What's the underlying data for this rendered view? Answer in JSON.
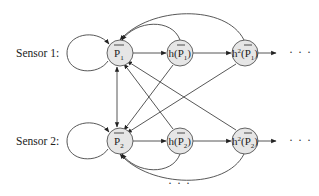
{
  "diagram": {
    "type": "state-transition graph",
    "rows": [
      {
        "label": "Sensor 1:",
        "nodes": [
          {
            "id": "P1",
            "base": "P",
            "sub": "1",
            "func": "",
            "power": ""
          },
          {
            "id": "hP1",
            "base": "P",
            "sub": "1",
            "func": "h",
            "power": ""
          },
          {
            "id": "h2P1",
            "base": "P",
            "sub": "1",
            "func": "h",
            "power": "2"
          }
        ],
        "trailing": "· · ·"
      },
      {
        "label": "Sensor 2:",
        "nodes": [
          {
            "id": "P2",
            "base": "P",
            "sub": "2",
            "func": "",
            "power": ""
          },
          {
            "id": "hP2",
            "base": "P",
            "sub": "2",
            "func": "h",
            "power": ""
          },
          {
            "id": "h2P2",
            "base": "P",
            "sub": "2",
            "func": "h",
            "power": "2"
          }
        ],
        "trailing": "· · ·"
      }
    ],
    "bottom_ellipsis": "· · ·",
    "edges": [
      {
        "from": "P1",
        "to": "P1",
        "kind": "self-loop"
      },
      {
        "from": "P1",
        "to": "hP1"
      },
      {
        "from": "hP1",
        "to": "h2P1"
      },
      {
        "from": "h2P1",
        "to": "more1"
      },
      {
        "from": "hP1",
        "to": "P1",
        "kind": "arc-top"
      },
      {
        "from": "h2P1",
        "to": "P1",
        "kind": "arc-top"
      },
      {
        "from": "P2",
        "to": "P2",
        "kind": "self-loop"
      },
      {
        "from": "P2",
        "to": "hP2"
      },
      {
        "from": "hP2",
        "to": "h2P2"
      },
      {
        "from": "h2P2",
        "to": "more2"
      },
      {
        "from": "hP2",
        "to": "P2",
        "kind": "arc-bottom"
      },
      {
        "from": "h2P2",
        "to": "P2",
        "kind": "arc-bottom"
      },
      {
        "from": "P1",
        "to": "P2",
        "kind": "bidirectional"
      },
      {
        "from": "hP1",
        "to": "P2"
      },
      {
        "from": "h2P1",
        "to": "P2"
      },
      {
        "from": "hP2",
        "to": "P1"
      },
      {
        "from": "h2P2",
        "to": "P1"
      }
    ]
  }
}
